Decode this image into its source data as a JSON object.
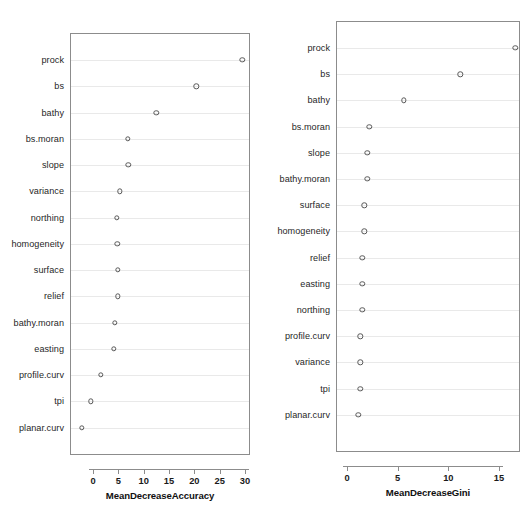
{
  "figure": {
    "title": "",
    "width": 532,
    "height": 507,
    "background": "#ffffff",
    "point_color": "#585858",
    "axis_color": "#8c8c8c",
    "gridline_color": "#e9e9e9"
  },
  "chart_data": [
    {
      "type": "scatter",
      "id": "mean-decrease-accuracy",
      "title": "",
      "xlabel": "MeanDecreaseAccuracy",
      "ylabel": "",
      "xlim": [
        -2.6,
        30.8
      ],
      "xticks": [
        0,
        5,
        10,
        15,
        20,
        25,
        30
      ],
      "xticklabels": [
        "0",
        "5",
        "10",
        "15",
        "20",
        "25",
        "30"
      ],
      "grid": true,
      "legend": false,
      "orientation": "horizontal-dotchart",
      "categories": [
        "prock",
        "bs",
        "bathy",
        "bs.moran",
        "slope",
        "variance",
        "northing",
        "homogeneity",
        "surface",
        "relief",
        "bathy.moran",
        "easting",
        "profile.curv",
        "tpi",
        "planar.curv"
      ],
      "values": [
        29.5,
        20.4,
        12.5,
        6.9,
        7.0,
        5.3,
        4.7,
        4.8,
        4.9,
        4.9,
        4.3,
        4.1,
        1.6,
        -0.4,
        -2.2
      ]
    },
    {
      "type": "scatter",
      "id": "mean-decrease-gini",
      "title": "",
      "xlabel": "MeanDecreaseGini",
      "ylabel": "",
      "xlim": [
        -0.2,
        17.2
      ],
      "xticks": [
        0,
        5,
        10,
        15
      ],
      "xticklabels": [
        "0",
        "5",
        "10",
        "15"
      ],
      "grid": true,
      "legend": false,
      "orientation": "horizontal-dotchart",
      "categories": [
        "prock",
        "bs",
        "bathy",
        "bs.moran",
        "slope",
        "bathy.moran",
        "surface",
        "homogeneity",
        "relief",
        "easting",
        "northing",
        "profile.curv",
        "variance",
        "tpi",
        "planar.curv"
      ],
      "values": [
        16.6,
        11.2,
        5.6,
        2.2,
        2.0,
        2.0,
        1.7,
        1.7,
        1.5,
        1.5,
        1.5,
        1.3,
        1.3,
        1.3,
        1.1
      ]
    }
  ]
}
